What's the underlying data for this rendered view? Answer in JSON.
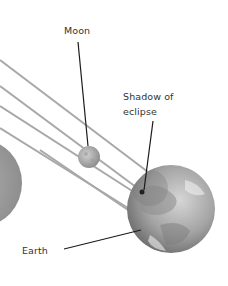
{
  "diagram": {
    "labels": {
      "moon": "Moon",
      "shadow_line1": "Shadow of",
      "shadow_line2": "eclipse",
      "earth": "Earth"
    },
    "colors": {
      "background": "#ffffff",
      "rays": "#a8a8a8",
      "leader_lines": "#1a1a1a",
      "sun": "#a0a0a0",
      "moon": "#b5b5b5",
      "earth": "#9a9a9a",
      "text": "#333333"
    }
  }
}
